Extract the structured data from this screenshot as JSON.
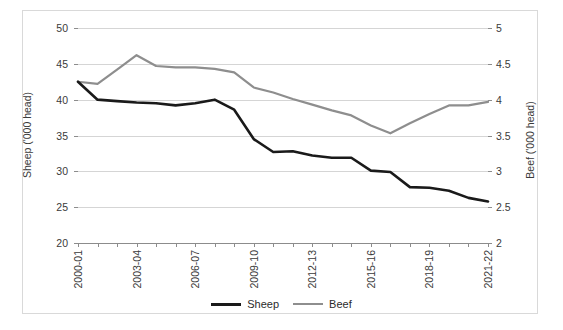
{
  "chart_data": {
    "type": "line",
    "title": "",
    "xlabel": "",
    "grid": true,
    "legend_position": "bottom",
    "x": [
      "2000-01",
      "2001-02",
      "2002-03",
      "2003-04",
      "2004-05",
      "2005-06",
      "2006-07",
      "2007-08",
      "2008-09",
      "2009-10",
      "2010-11",
      "2011-12",
      "2012-13",
      "2013-14",
      "2014-15",
      "2015-16",
      "2016-17",
      "2017-18",
      "2018-19",
      "2019-20",
      "2020-21",
      "2021-22"
    ],
    "x_tick_labels": [
      "2000-01",
      "2003-04",
      "2006-07",
      "2009-10",
      "2012-13",
      "2015-16",
      "2018-19",
      "2021-22"
    ],
    "axes": {
      "left": {
        "label": "Sheep ('000 head)",
        "ylim": [
          20,
          50
        ],
        "ticks": [
          20,
          25,
          30,
          35,
          40,
          45,
          50
        ],
        "tick_labels": [
          "20",
          "25",
          "30",
          "35",
          "40",
          "45",
          "50"
        ]
      },
      "right": {
        "label": "Beef ('000 head)",
        "ylim": [
          2,
          5
        ],
        "ticks": [
          2,
          2.5,
          3,
          3.5,
          4,
          4.5,
          5
        ],
        "tick_labels": [
          "2",
          "2.5",
          "3",
          "3.5",
          "4",
          "4.5",
          "5"
        ]
      }
    },
    "series": [
      {
        "name": "Sheep",
        "axis": "left",
        "color": "#1a1a1a",
        "width": 2.6,
        "values": [
          42.5,
          40.0,
          39.8,
          39.6,
          39.5,
          39.2,
          39.5,
          40.0,
          38.6,
          34.5,
          32.7,
          32.8,
          32.2,
          31.9,
          31.9,
          30.1,
          29.9,
          27.8,
          27.7,
          27.3,
          26.3,
          25.8
        ]
      },
      {
        "name": "Beef",
        "axis": "right",
        "color": "#8e8e8e",
        "width": 2.2,
        "values": [
          4.25,
          4.22,
          4.42,
          4.62,
          4.47,
          4.45,
          4.45,
          4.43,
          4.38,
          4.17,
          4.1,
          4.01,
          3.93,
          3.85,
          3.78,
          3.64,
          3.53,
          3.67,
          3.8,
          3.92,
          3.92,
          3.97
        ]
      }
    ]
  },
  "legend": {
    "items": [
      {
        "label": "Sheep",
        "color": "#1a1a1a"
      },
      {
        "label": "Beef",
        "color": "#8e8e8e"
      }
    ]
  }
}
